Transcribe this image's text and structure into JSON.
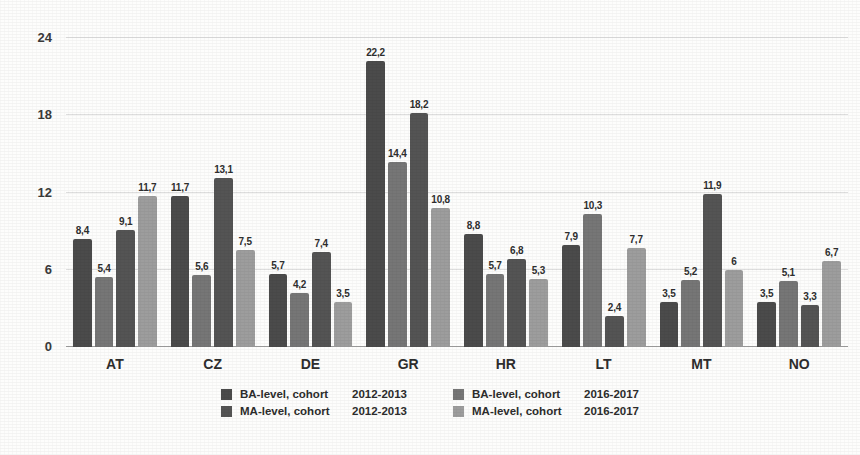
{
  "chart_data": {
    "type": "bar",
    "title": "",
    "subtitle": "",
    "xlabel": "",
    "ylabel": "",
    "ylim": [
      0,
      24
    ],
    "yticks": [
      "0",
      "6",
      "12",
      "18",
      "24"
    ],
    "ytick_values": [
      0,
      6,
      12,
      18,
      24
    ],
    "grid": true,
    "legend_position": "bottom",
    "categories": [
      "AT",
      "CZ",
      "DE",
      "GR",
      "HR",
      "LT",
      "MT",
      "NO"
    ],
    "series": [
      {
        "name": "BA-level, cohort  2012-2013",
        "level": "BA-level, cohort",
        "cohort": "2012-2013",
        "color": "#4b4b4b",
        "values": [
          8.4,
          11.7,
          5.7,
          22.2,
          8.8,
          7.9,
          3.5,
          3.5
        ],
        "labels": [
          "8,4",
          "11,7",
          "5,7",
          "22,2",
          "8,8",
          "7,9",
          "3,5",
          "3,5"
        ]
      },
      {
        "name": "BA-level, cohort  2016-2017",
        "level": "BA-level, cohort",
        "cohort": "2016-2017",
        "color": "#767676",
        "values": [
          5.4,
          5.6,
          4.2,
          14.4,
          5.7,
          10.3,
          5.2,
          5.1
        ],
        "labels": [
          "5,4",
          "5,6",
          "4,2",
          "14,4",
          "5,7",
          "10,3",
          "5,2",
          "5,1"
        ]
      },
      {
        "name": "MA-level, cohort  2012-2013",
        "level": "MA-level, cohort",
        "cohort": "2012-2013",
        "color": "#545454",
        "values": [
          9.1,
          13.1,
          7.4,
          18.2,
          6.8,
          2.4,
          11.9,
          3.3
        ],
        "labels": [
          "9,1",
          "13,1",
          "7,4",
          "18,2",
          "6,8",
          "2,4",
          "11,9",
          "3,3"
        ]
      },
      {
        "name": "MA-level, cohort  2016-2017",
        "level": "MA-level, cohort",
        "cohort": "2016-2017",
        "color": "#9d9d9d",
        "values": [
          11.7,
          7.5,
          3.5,
          10.8,
          5.3,
          7.7,
          6.0,
          6.7
        ],
        "labels": [
          "11,7",
          "7,5",
          "3,5",
          "10,8",
          "5,3",
          "7,7",
          "6",
          "6,7"
        ]
      }
    ]
  },
  "legend": {
    "columns": [
      [
        {
          "label": "BA-level, cohort",
          "cohort": "2012-2013",
          "color": "#4b4b4b"
        },
        {
          "label": "MA-level, cohort",
          "cohort": "2012-2013",
          "color": "#545454"
        }
      ],
      [
        {
          "label": "BA-level, cohort",
          "cohort": "2016-2017",
          "color": "#767676"
        },
        {
          "label": "MA-level, cohort",
          "cohort": "2016-2017",
          "color": "#9d9d9d"
        }
      ]
    ]
  }
}
